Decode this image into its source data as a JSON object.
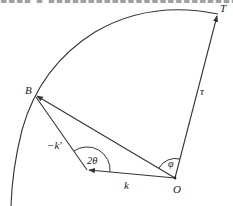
{
  "header": {
    "clipped_text": "▪▪▪▪ ▪ ▪▪▪▪▪▪▪▪▪▪▪▪▪▪▪▪▪▪▪▪▪▪▪▪▪▪▪▪▪▪▪▪"
  },
  "diagram": {
    "points": {
      "T": {
        "label": "T",
        "x": 218,
        "y": 14
      },
      "B": {
        "label": "B",
        "x": 35,
        "y": 95
      },
      "O": {
        "label": "O",
        "x": 175,
        "y": 178
      },
      "V": {
        "label": "",
        "x": 87,
        "y": 170
      }
    },
    "labels": {
      "tau": "τ",
      "k": "k",
      "neg_k_prime": "−k′",
      "phi": "φ",
      "two_theta": "2θ"
    },
    "colors": {
      "stroke": "#333333",
      "text": "#222222",
      "background": "#ffffff"
    }
  }
}
